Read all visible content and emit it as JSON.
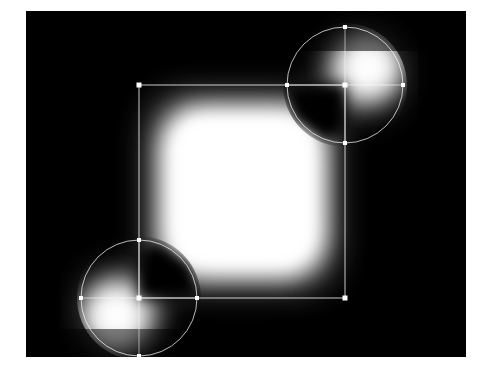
{
  "figure": {
    "title": "Signed distance field of rectangle with two disks",
    "background_color": "#ffffff",
    "plot_background_color": "#000000",
    "overlay_color": "#ffffff",
    "glow_color": "#ffffff"
  },
  "plot_area": {
    "x": 26,
    "y": 11,
    "width": 440,
    "height": 346
  },
  "chart_data": {
    "type": "heatmap",
    "title": "Signed distance field of rectangle with two disks",
    "xlabel": "",
    "ylabel": "",
    "colormap": "gray",
    "grid": false,
    "legend": null,
    "xlim": [
      0,
      440
    ],
    "ylim": [
      0,
      346
    ],
    "value_range": [
      0,
      1
    ],
    "shapes": [
      {
        "name": "rectangle",
        "kind": "rect",
        "x": 113,
        "y": 74,
        "width": 206,
        "height": 213,
        "corners": [
          {
            "label": "top-left",
            "x": 113,
            "y": 74
          },
          {
            "label": "top-right",
            "x": 319,
            "y": 74
          },
          {
            "label": "bottom-right",
            "x": 319,
            "y": 287
          },
          {
            "label": "bottom-left",
            "x": 113,
            "y": 287
          }
        ]
      },
      {
        "name": "circle-top-right",
        "kind": "circle",
        "cx": 319,
        "cy": 74,
        "r": 58,
        "markers": [
          {
            "label": "north",
            "x": 319,
            "y": 16
          },
          {
            "label": "east",
            "x": 377,
            "y": 74
          },
          {
            "label": "south",
            "x": 319,
            "y": 132
          },
          {
            "label": "west",
            "x": 261,
            "y": 74
          }
        ],
        "notch_quadrant": "lower-left"
      },
      {
        "name": "circle-bottom-left",
        "kind": "circle",
        "cx": 113,
        "cy": 287,
        "r": 58,
        "markers": [
          {
            "label": "north",
            "x": 113,
            "y": 229
          },
          {
            "label": "east",
            "x": 171,
            "y": 287
          },
          {
            "label": "south",
            "x": 113,
            "y": 345
          },
          {
            "label": "west",
            "x": 55,
            "y": 287
          }
        ],
        "notch_quadrant": "upper-right"
      }
    ],
    "glow_sources": [
      {
        "name": "rect-core",
        "cx": 216,
        "cy": 180,
        "intensity": 1.0
      },
      {
        "name": "disk-tr-core",
        "cx": 342,
        "cy": 58,
        "intensity": 0.92
      },
      {
        "name": "disk-bl-core",
        "cx": 90,
        "cy": 303,
        "intensity": 0.92
      }
    ]
  }
}
